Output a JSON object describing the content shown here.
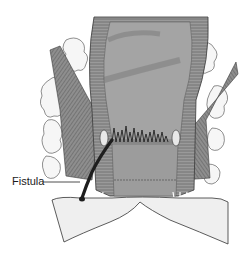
{
  "diagram": {
    "labels": [
      {
        "text": "Fistula",
        "target": "fistula-tract"
      }
    ]
  },
  "colors": {
    "background": "#ffffff",
    "muscle": "#8c8c8c",
    "muscle_dark": "#5e5e5e",
    "lumen": "#9e9e9e",
    "fat": "#f4f4f4",
    "skin": "#ececec",
    "fistula": "#222222",
    "outline": "#3a3a3a"
  }
}
